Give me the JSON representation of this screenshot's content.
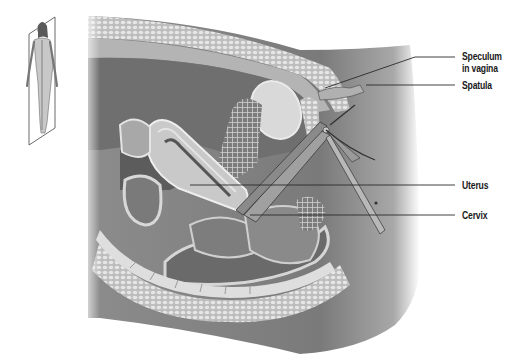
{
  "figure": {
    "orientation_inset": "standing female figure with sagittal plane",
    "labels": [
      {
        "id": "speculum",
        "lines": [
          "Speculum",
          "in vagina"
        ]
      },
      {
        "id": "spatula",
        "lines": [
          "Spatula"
        ]
      },
      {
        "id": "uterus",
        "lines": [
          "Uterus"
        ]
      },
      {
        "id": "cervix",
        "lines": [
          "Cervix"
        ]
      }
    ]
  },
  "colors": {
    "background": "#ffffff",
    "tissue_dark": "#6e6e6e",
    "tissue_mid": "#9a9a9a",
    "tissue_light": "#d6d6d6",
    "leader_line": "#2a2a2a",
    "label_text": "#1a1a1a"
  }
}
